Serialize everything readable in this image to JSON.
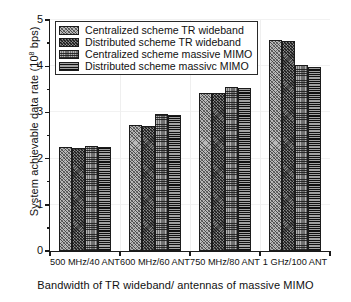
{
  "chart_data": {
    "type": "bar",
    "title": "",
    "xlabel": "Bandwidth of TR  wideband/ antennas of massive MIMO",
    "ylabel": "System achievable data rate (10⁸ bps)",
    "ylabel_text": "System achievable data rate (10",
    "ylabel_exp": "8",
    "ylabel_tail": " bps)",
    "categories": [
      "500 MHz/40 ANT",
      "600 MHz/60 ANT",
      "750 MHz/80 ANT",
      "1 GHz/100 ANT"
    ],
    "series": [
      {
        "name": "Centralized  scheme TR  wideband",
        "values": [
          2.25,
          2.72,
          3.43,
          4.56
        ],
        "pattern": "diagonal-crosshatch-light",
        "color": "#b9b9b9"
      },
      {
        "name": "Distributed  scheme TR  wideband",
        "values": [
          2.24,
          2.7,
          3.41,
          4.54
        ],
        "pattern": "diagonal-crosshatch-dark",
        "color": "#4a4a4a"
      },
      {
        "name": "Centralized  scheme massive MIMO",
        "values": [
          2.28,
          2.96,
          3.56,
          4.02
        ],
        "pattern": "checkerboard-medium",
        "color": "#6f6f6f"
      },
      {
        "name": "Distributed  scheme massivc MIMO",
        "values": [
          2.25,
          2.94,
          3.52,
          3.99
        ],
        "pattern": "horizontal-lines-dark",
        "color": "#2d2d2d"
      }
    ],
    "ylim": [
      0,
      5
    ],
    "yticks": [
      0,
      1,
      2,
      3,
      4,
      5
    ],
    "ytick_labels": [
      "0",
      "1",
      "2",
      "3",
      "4",
      "5"
    ],
    "yminor_ticks": [
      0.5,
      1.5,
      2.5,
      3.5,
      4.5
    ],
    "grid": true,
    "legend_position": "top-left"
  },
  "legend": {
    "items": [
      {
        "label": "Centralized  scheme TR  wideband"
      },
      {
        "label": "Distributed  scheme TR  wideband"
      },
      {
        "label": "Centralized  scheme massive MIMO"
      },
      {
        "label": "Distributed  scheme massivc MIMO"
      }
    ]
  }
}
